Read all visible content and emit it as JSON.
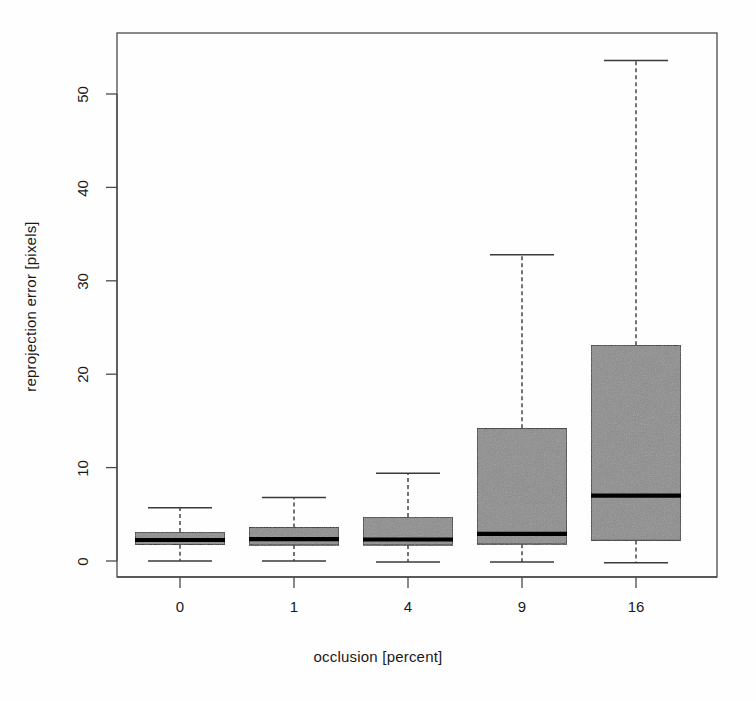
{
  "chart_data": {
    "type": "box",
    "title": "",
    "xlabel": "occlusion [percent]",
    "ylabel": "reprojection error [pixels]",
    "categories": [
      "0",
      "1",
      "4",
      "9",
      "16"
    ],
    "ylim": [
      -1.5,
      57
    ],
    "yticks": [
      0,
      10,
      20,
      30,
      40,
      50
    ],
    "ytick_labels": [
      "0",
      "10",
      "20",
      "30",
      "40",
      "50"
    ],
    "grid": false,
    "legend": null,
    "box_fill_color": "#8b8b8b",
    "box_line_color": "#1a1a1a",
    "median_color": "#000000",
    "whisker_style": "dashed",
    "boxes": [
      {
        "category": "0",
        "whisker_low": 0.0,
        "q1": 1.75,
        "median": 2.25,
        "q3": 3.1,
        "whisker_high": 5.7
      },
      {
        "category": "1",
        "whisker_low": 0.0,
        "q1": 1.7,
        "median": 2.35,
        "q3": 3.6,
        "whisker_high": 6.8
      },
      {
        "category": "4",
        "whisker_low": -0.1,
        "q1": 1.7,
        "median": 2.3,
        "q3": 4.7,
        "whisker_high": 9.4
      },
      {
        "category": "9",
        "whisker_low": -0.1,
        "q1": 1.8,
        "median": 2.9,
        "q3": 14.2,
        "whisker_high": 32.8
      },
      {
        "category": "16",
        "whisker_low": -0.2,
        "q1": 2.2,
        "median": 7.0,
        "q3": 23.1,
        "whisker_high": 53.6
      }
    ]
  },
  "axis": {
    "ylabel_text": "reprojection error [pixels]",
    "xlabel_text": "occlusion [percent]",
    "ytick_0": "0",
    "ytick_1": "10",
    "ytick_2": "20",
    "ytick_3": "30",
    "ytick_4": "40",
    "ytick_5": "50",
    "xtick_0": "0",
    "xtick_1": "1",
    "xtick_2": "4",
    "xtick_3": "9",
    "xtick_4": "16"
  }
}
